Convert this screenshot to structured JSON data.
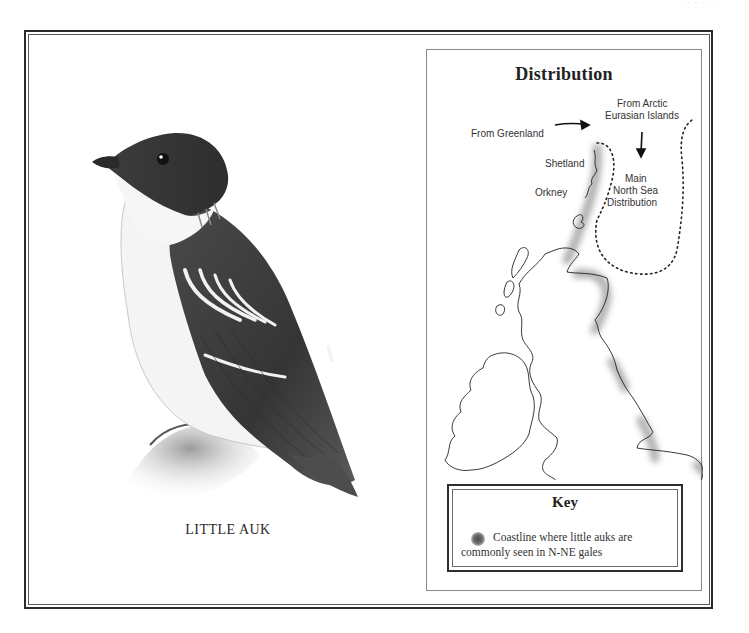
{
  "page": {
    "running_head": "· · · · · ·"
  },
  "illustration": {
    "subject": "little-auk-bird",
    "caption": "LITTLE AUK"
  },
  "map": {
    "title": "Distribution",
    "labels": {
      "from_arctic": [
        "From Arctic",
        "Eurasian Islands"
      ],
      "from_greenland": "From Greenland",
      "shetland": "Shetland",
      "orkney": "Orkney",
      "main_distribution": [
        "Main",
        "North Sea",
        "Distribution"
      ]
    },
    "key": {
      "title": "Key",
      "swatch_color": "#5a5a5a",
      "description": "Coastline where little auks are commonly seen in N-NE gales"
    }
  },
  "colors": {
    "frame": "#2b2b2b",
    "shading": "#6d6d6d",
    "background": "#ffffff"
  }
}
